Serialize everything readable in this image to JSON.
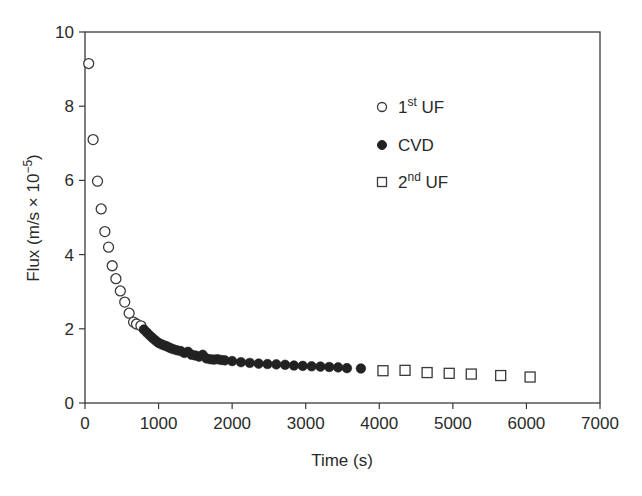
{
  "chart_data": {
    "type": "scatter",
    "title": "",
    "xlabel": "Time (s)",
    "ylabel": "Flux (m/s × 10⁻⁵)",
    "xlim": [
      0,
      7000
    ],
    "ylim": [
      0,
      10
    ],
    "xticks": [
      0,
      1000,
      2000,
      3000,
      4000,
      5000,
      6000,
      7000
    ],
    "yticks": [
      0,
      2,
      4,
      6,
      8,
      10
    ],
    "grid": false,
    "legend_position": "upper right (inside)",
    "series": [
      {
        "name": "1st UF",
        "marker": "open-circle",
        "x": [
          50,
          110,
          170,
          220,
          270,
          320,
          370,
          420,
          480,
          540,
          600,
          660,
          700,
          760
        ],
        "y": [
          9.15,
          7.1,
          5.98,
          5.23,
          4.62,
          4.2,
          3.7,
          3.35,
          3.02,
          2.72,
          2.42,
          2.18,
          2.13,
          2.08
        ]
      },
      {
        "name": "CVD",
        "marker": "filled-circle",
        "x": [
          800,
          840,
          880,
          920,
          960,
          1000,
          1040,
          1080,
          1120,
          1160,
          1200,
          1250,
          1300,
          1350,
          1400,
          1450,
          1500,
          1550,
          1600,
          1650,
          1700,
          1750,
          1800,
          1850,
          1900,
          2000,
          2120,
          2240,
          2360,
          2480,
          2600,
          2720,
          2840,
          2960,
          3080,
          3200,
          3320,
          3440,
          3560,
          3750
        ],
        "y": [
          1.98,
          1.9,
          1.82,
          1.75,
          1.68,
          1.62,
          1.58,
          1.55,
          1.52,
          1.48,
          1.45,
          1.42,
          1.4,
          1.35,
          1.38,
          1.3,
          1.28,
          1.25,
          1.3,
          1.2,
          1.18,
          1.17,
          1.18,
          1.16,
          1.15,
          1.13,
          1.1,
          1.08,
          1.06,
          1.05,
          1.04,
          1.03,
          1.01,
          1.0,
          0.99,
          0.98,
          0.97,
          0.96,
          0.94,
          0.93
        ]
      },
      {
        "name": "2nd UF",
        "marker": "open-square",
        "x": [
          4050,
          4350,
          4650,
          4950,
          5250,
          5650,
          6050
        ],
        "y": [
          0.87,
          0.88,
          0.82,
          0.8,
          0.78,
          0.74,
          0.7
        ]
      }
    ]
  },
  "axes": {
    "x_title": "Time (s)",
    "y_title_main": "Flux (m/s × 10",
    "y_title_exp": "−5",
    "y_title_close": ")",
    "x_tick_labels": [
      "0",
      "1000",
      "2000",
      "3000",
      "4000",
      "5000",
      "6000",
      "7000"
    ],
    "y_tick_labels": [
      "0",
      "2",
      "4",
      "6",
      "8",
      "10"
    ]
  },
  "legend": [
    {
      "num": "1",
      "sup": "st",
      "rest": " UF",
      "marker": "open-circle"
    },
    {
      "num": "CVD",
      "sup": "",
      "rest": "",
      "marker": "filled-circle"
    },
    {
      "num": "2",
      "sup": "nd",
      "rest": " UF",
      "marker": "open-square"
    }
  ]
}
